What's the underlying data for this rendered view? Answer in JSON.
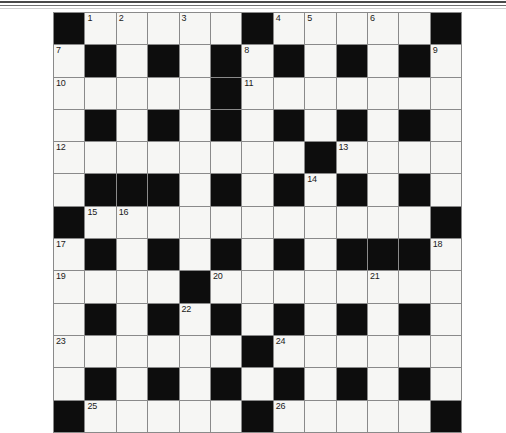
{
  "page": {
    "background_color": "#ffffff",
    "rules": [
      {
        "name": "top-rule-thick",
        "color": "#4a4a4a"
      },
      {
        "name": "top-rule-thin",
        "color": "#6e6e6e"
      },
      {
        "name": "top-rule-faint",
        "color": "#cfcfcf"
      }
    ]
  },
  "crossword": {
    "rows": 13,
    "columns": 13,
    "cell_width_px": 30.4,
    "cell_height_px": 31.3,
    "colors": {
      "white_cell": "#f6f6f4",
      "black_cell": "#0d0d0d",
      "grid_line": "#8a8a8a",
      "number_text": "#1a1a1a"
    },
    "legend": {
      "1": "black square (blocked)",
      "0": "white square (fillable)"
    },
    "grid": [
      [
        1,
        0,
        0,
        0,
        0,
        0,
        1,
        0,
        0,
        0,
        0,
        0,
        1
      ],
      [
        0,
        1,
        0,
        1,
        0,
        1,
        0,
        1,
        0,
        1,
        0,
        1,
        0
      ],
      [
        0,
        0,
        0,
        0,
        0,
        1,
        0,
        0,
        0,
        0,
        0,
        0,
        0
      ],
      [
        0,
        1,
        0,
        1,
        0,
        1,
        0,
        1,
        0,
        1,
        0,
        1,
        0
      ],
      [
        0,
        0,
        0,
        0,
        0,
        0,
        0,
        0,
        1,
        0,
        0,
        0,
        0
      ],
      [
        0,
        1,
        1,
        1,
        0,
        1,
        0,
        1,
        0,
        1,
        0,
        1,
        0
      ],
      [
        1,
        0,
        0,
        0,
        0,
        0,
        0,
        0,
        0,
        0,
        0,
        0,
        1
      ],
      [
        0,
        1,
        0,
        1,
        0,
        1,
        0,
        1,
        0,
        1,
        1,
        1,
        0
      ],
      [
        0,
        0,
        0,
        0,
        1,
        0,
        0,
        0,
        0,
        0,
        0,
        0,
        0
      ],
      [
        0,
        1,
        0,
        1,
        0,
        1,
        0,
        1,
        0,
        1,
        0,
        1,
        0
      ],
      [
        0,
        0,
        0,
        0,
        0,
        0,
        1,
        0,
        0,
        0,
        0,
        0,
        0
      ],
      [
        0,
        1,
        0,
        1,
        0,
        1,
        0,
        1,
        0,
        1,
        0,
        1,
        0
      ],
      [
        1,
        0,
        0,
        0,
        0,
        0,
        1,
        0,
        0,
        0,
        0,
        0,
        1
      ]
    ],
    "numbers": [
      {
        "number": "1",
        "row": 0,
        "col": 1
      },
      {
        "number": "2",
        "row": 0,
        "col": 2
      },
      {
        "number": "3",
        "row": 0,
        "col": 4
      },
      {
        "number": "4",
        "row": 0,
        "col": 7
      },
      {
        "number": "5",
        "row": 0,
        "col": 8
      },
      {
        "number": "6",
        "row": 0,
        "col": 10
      },
      {
        "number": "7",
        "row": 1,
        "col": 0
      },
      {
        "number": "8",
        "row": 1,
        "col": 6
      },
      {
        "number": "9",
        "row": 1,
        "col": 12
      },
      {
        "number": "10",
        "row": 2,
        "col": 0
      },
      {
        "number": "11",
        "row": 2,
        "col": 6
      },
      {
        "number": "12",
        "row": 4,
        "col": 0
      },
      {
        "number": "13",
        "row": 4,
        "col": 9
      },
      {
        "number": "14",
        "row": 5,
        "col": 8
      },
      {
        "number": "15",
        "row": 6,
        "col": 1
      },
      {
        "number": "16",
        "row": 6,
        "col": 2
      },
      {
        "number": "17",
        "row": 7,
        "col": 0
      },
      {
        "number": "18",
        "row": 7,
        "col": 12
      },
      {
        "number": "19",
        "row": 8,
        "col": 0
      },
      {
        "number": "20",
        "row": 8,
        "col": 5
      },
      {
        "number": "21",
        "row": 8,
        "col": 10
      },
      {
        "number": "22",
        "row": 9,
        "col": 4
      },
      {
        "number": "23",
        "row": 10,
        "col": 0
      },
      {
        "number": "24",
        "row": 10,
        "col": 7
      },
      {
        "number": "25",
        "row": 12,
        "col": 1
      },
      {
        "number": "26",
        "row": 12,
        "col": 7
      }
    ]
  }
}
